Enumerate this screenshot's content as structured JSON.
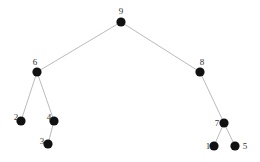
{
  "diagram": {
    "type": "tree",
    "colors": {
      "node": "#111111",
      "edge": "#a8a8a8",
      "label": "#333333",
      "background": "#ffffff"
    },
    "nodes": [
      {
        "id": "9",
        "label": "9",
        "x": 121,
        "y": 22,
        "lx": 121,
        "ly": 14,
        "anchor": "middle"
      },
      {
        "id": "6",
        "label": "6",
        "x": 37,
        "y": 72,
        "lx": 35,
        "ly": 65,
        "anchor": "middle"
      },
      {
        "id": "8",
        "label": "8",
        "x": 200,
        "y": 72,
        "lx": 202,
        "ly": 65,
        "anchor": "middle"
      },
      {
        "id": "2",
        "label": "2",
        "x": 21,
        "y": 121,
        "lx": 16,
        "ly": 120,
        "anchor": "middle"
      },
      {
        "id": "4",
        "label": "4",
        "x": 54,
        "y": 121,
        "lx": 49,
        "ly": 120,
        "anchor": "middle"
      },
      {
        "id": "3",
        "label": "3",
        "x": 48,
        "y": 144,
        "lx": 42,
        "ly": 144,
        "anchor": "middle"
      },
      {
        "id": "7",
        "label": "7",
        "x": 224,
        "y": 123,
        "lx": 217,
        "ly": 126,
        "anchor": "middle"
      },
      {
        "id": "1",
        "label": "1",
        "x": 214,
        "y": 146,
        "lx": 208,
        "ly": 149,
        "anchor": "middle"
      },
      {
        "id": "5",
        "label": "5",
        "x": 235,
        "y": 146,
        "lx": 245,
        "ly": 149,
        "anchor": "middle"
      }
    ],
    "edges": [
      {
        "from": "9",
        "to": "6"
      },
      {
        "from": "9",
        "to": "8"
      },
      {
        "from": "6",
        "to": "2"
      },
      {
        "from": "6",
        "to": "4"
      },
      {
        "from": "4",
        "to": "3"
      },
      {
        "from": "8",
        "to": "7"
      },
      {
        "from": "7",
        "to": "1"
      },
      {
        "from": "7",
        "to": "5"
      }
    ]
  }
}
